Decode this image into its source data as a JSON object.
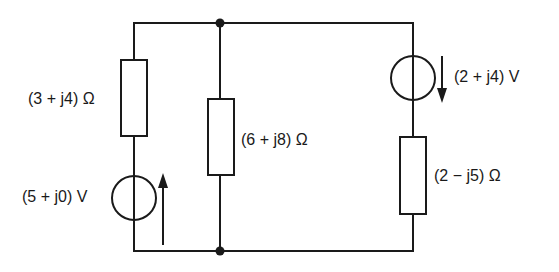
{
  "diagram": {
    "type": "ac-circuit",
    "colors": {
      "stroke": "#1a1a1a",
      "background": "#ffffff"
    },
    "nodes": [
      {
        "id": "top",
        "x": 220,
        "y": 23
      },
      {
        "id": "bottom",
        "x": 220,
        "y": 251
      }
    ],
    "branches": [
      {
        "id": "left",
        "components": [
          {
            "kind": "impedance",
            "label": "(3 + j4) Ω"
          },
          {
            "kind": "voltage-source",
            "label": "(5 + j0) V",
            "arrow": "up"
          }
        ]
      },
      {
        "id": "middle",
        "components": [
          {
            "kind": "impedance",
            "label": "(6 + j8) Ω"
          }
        ]
      },
      {
        "id": "right",
        "components": [
          {
            "kind": "voltage-source",
            "label": "(2 + j4) V",
            "arrow": "down"
          },
          {
            "kind": "impedance",
            "label": "(2 − j5) Ω"
          }
        ]
      }
    ]
  },
  "labels": {
    "z1": "(3 + j4) Ω",
    "v1": "(5 + j0) V",
    "z2": "(6 + j8) Ω",
    "v2": "(2 + j4) V",
    "z3": "(2 − j5) Ω"
  }
}
